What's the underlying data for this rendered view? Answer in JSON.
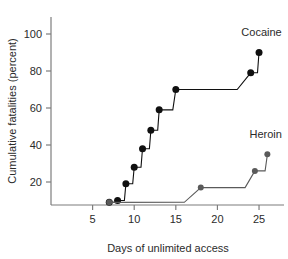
{
  "chart_data": {
    "type": "line",
    "title": "",
    "xlabel": "Days of unlimited access",
    "ylabel": "Cumulative fatalities (percent)",
    "xlim": [
      0,
      28
    ],
    "ylim": [
      0,
      100
    ],
    "grid": false,
    "legend_position": "inline-right-of-series",
    "xticks": [
      5,
      10,
      15,
      20,
      25
    ],
    "xtick_labels": [
      "5",
      "10",
      "15",
      "20",
      "25"
    ],
    "yticks": [
      20,
      40,
      60,
      80,
      100
    ],
    "ytick_labels": [
      "20",
      "40",
      "60",
      "80",
      "100"
    ],
    "series": [
      {
        "name": "Cocaine",
        "color": "#101010",
        "marker": "circle",
        "marker_size": 7,
        "step": "post",
        "points": [
          {
            "x": 7,
            "y": 9
          },
          {
            "x": 8,
            "y": 10
          },
          {
            "x": 9,
            "y": 19
          },
          {
            "x": 10,
            "y": 28
          },
          {
            "x": 11,
            "y": 38
          },
          {
            "x": 12,
            "y": 48
          },
          {
            "x": 13,
            "y": 59
          },
          {
            "x": 15,
            "y": 70
          },
          {
            "x": 24,
            "y": 79
          },
          {
            "x": 25,
            "y": 90
          }
        ]
      },
      {
        "name": "Heroin",
        "color": "#5a5a5a",
        "marker": "circle",
        "marker_size": 6,
        "step": "post",
        "points": [
          {
            "x": 7,
            "y": 9
          },
          {
            "x": 18,
            "y": 17
          },
          {
            "x": 24.5,
            "y": 26
          },
          {
            "x": 26,
            "y": 35
          }
        ]
      }
    ],
    "annotations": [
      {
        "text": "Cocaine",
        "x": 25.3,
        "y": 99,
        "series": "Cocaine"
      },
      {
        "text": "Heroin",
        "x": 25.8,
        "y": 44,
        "series": "Heroin"
      }
    ]
  }
}
